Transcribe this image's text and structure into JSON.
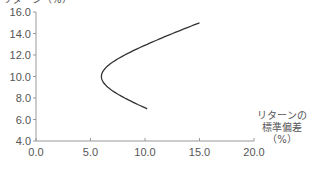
{
  "chart_data": {
    "type": "line",
    "title": "",
    "xlabel": "リターンの標準偏差（%）",
    "xlabel_lines": [
      "リターンの",
      "標準偏差",
      "（%）"
    ],
    "ylabel": "リターン（%）",
    "ylabel_partial": "リターン（%）",
    "xlim": [
      0.0,
      20.0
    ],
    "ylim": [
      4.0,
      16.0
    ],
    "xticks": [
      "0.0",
      "5.0",
      "10.0",
      "15.0",
      "20.0"
    ],
    "yticks": [
      "4.0",
      "6.0",
      "8.0",
      "10.0",
      "12.0",
      "14.0",
      "16.0"
    ],
    "grid": false,
    "legend": null,
    "series": [
      {
        "name": "efficient frontier",
        "x": [
          10.3,
          8.4,
          7.1,
          6.3,
          6.0,
          6.3,
          7.1,
          8.4,
          10.0,
          11.7,
          13.4,
          15.0
        ],
        "y": [
          7.0,
          8.0,
          9.0,
          9.6,
          10.0,
          10.4,
          11.0,
          12.0,
          12.8,
          13.6,
          14.3,
          15.0
        ]
      }
    ]
  }
}
